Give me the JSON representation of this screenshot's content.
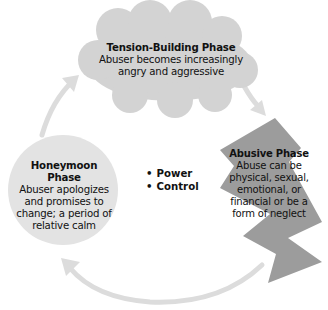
{
  "diagram": {
    "center": {
      "items": [
        "Power",
        "Control"
      ]
    },
    "phases": [
      {
        "id": "tension",
        "shape": "cloud",
        "title": "Tension-Building Phase",
        "description": "Abuser becomes increasingly angry and aggressive",
        "color": "#d3d3d3"
      },
      {
        "id": "abusive",
        "shape": "lightning",
        "title": "Abusive Phase",
        "description": "Abuse can be physical, sexual, emotional, or financial or be a form of neglect",
        "color": "#9c9c9c"
      },
      {
        "id": "honeymoon",
        "shape": "circle",
        "title": "Honeymoon Phase",
        "description": "Abuser apologizes and promises to change; a period of relative calm",
        "color": "#e3e3e3"
      }
    ],
    "arrows": [
      {
        "from": "tension",
        "to": "abusive"
      },
      {
        "from": "abusive",
        "to": "honeymoon"
      },
      {
        "from": "honeymoon",
        "to": "tension"
      }
    ],
    "arrow_color": "#dcdcdc"
  }
}
